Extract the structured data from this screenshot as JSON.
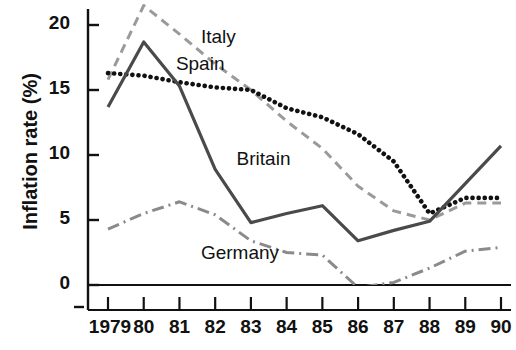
{
  "chart_data": {
    "type": "line",
    "title": "",
    "xlabel": "",
    "ylabel": "Inflation rate (%)",
    "x": [
      1979,
      1980,
      1981,
      1982,
      1983,
      1984,
      1985,
      1986,
      1987,
      1988,
      1989,
      1990
    ],
    "xtick_labels": [
      "1979",
      "80",
      "81",
      "82",
      "83",
      "84",
      "85",
      "86",
      "87",
      "88",
      "89",
      "90"
    ],
    "ytick_labels": [
      "0",
      "5",
      "10",
      "15",
      "20"
    ],
    "ytick_values": [
      0,
      5,
      10,
      15,
      20
    ],
    "ylim": [
      -2.0,
      22.5
    ],
    "grid": false,
    "legend_position": "inline-annotations",
    "series": [
      {
        "name": "Italy",
        "style": "dashed",
        "color": "#9a9a9a",
        "values": [
          15.8,
          21.5,
          19.3,
          17.0,
          15.0,
          12.6,
          10.5,
          7.6,
          5.7,
          5.0,
          6.3,
          6.3
        ],
        "label_x": 1981.6,
        "label_y": 19.0
      },
      {
        "name": "Spain",
        "style": "dotted",
        "color": "#111111",
        "values": [
          16.3,
          16.1,
          15.6,
          15.2,
          15.0,
          13.6,
          12.9,
          11.6,
          9.5,
          5.5,
          6.7,
          6.7
        ],
        "label_x": 1980.9,
        "label_y": 16.9
      },
      {
        "name": "Britain",
        "style": "solid",
        "color": "#4a4a4a",
        "values": [
          13.7,
          18.7,
          15.3,
          8.9,
          4.8,
          5.5,
          6.1,
          3.4,
          4.2,
          4.9,
          7.8,
          10.7
        ],
        "label_x": 1982.6,
        "label_y": 9.6
      },
      {
        "name": "Germany",
        "style": "dashdot",
        "color": "#8a8a8a",
        "values": [
          4.3,
          5.5,
          6.4,
          5.4,
          3.4,
          2.5,
          2.3,
          -0.2,
          0.2,
          1.3,
          2.6,
          2.9
        ],
        "label_x": 1981.6,
        "label_y": 2.4
      }
    ]
  },
  "axis": {
    "zero_line": true
  }
}
